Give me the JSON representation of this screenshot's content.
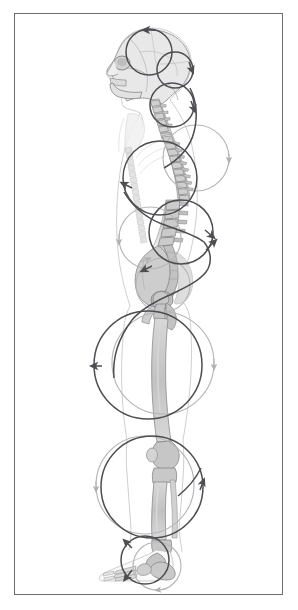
{
  "figure": {
    "title": "Spiral / circular motion pattern along the human skeleton in lateral (sagittal) view",
    "view": "lateral left side profile",
    "frame": {
      "border_color": "#6e6e6e",
      "background_color": "#ffffff",
      "inset_left": 14,
      "inset_top": 13,
      "width": 269,
      "height": 582
    },
    "palette": {
      "bone_fill": "#c9c9c9",
      "bone_fill_light": "#dedede",
      "bone_outline": "#8d8d8d",
      "body_outline": "#c4c4c4",
      "arrow_dark": "#4d4d52",
      "arrow_light": "#b3b3b3",
      "frame_line": "#6e6e6e",
      "background": "#ffffff"
    },
    "anatomy_regions": [
      {
        "name": "skull",
        "label": "Skull / cranium",
        "cy": 55
      },
      {
        "name": "mandible",
        "label": "Mandible and facial profile",
        "cy": 72
      },
      {
        "name": "cervical-spine",
        "label": "Cervical vertebrae C1-C7",
        "cy": 100
      },
      {
        "name": "thoracic-spine",
        "label": "Thoracic vertebrae T1-T12",
        "cy": 165
      },
      {
        "name": "lumbar-spine",
        "label": "Lumbar vertebrae L1-L5",
        "cy": 235
      },
      {
        "name": "sacrum-pelvis",
        "label": "Sacrum, ilium and pelvis",
        "cy": 285
      },
      {
        "name": "femur",
        "label": "Femur / thigh",
        "cy": 370
      },
      {
        "name": "knee",
        "label": "Knee joint",
        "cy": 432
      },
      {
        "name": "tibia-fibula",
        "label": "Tibia and fibula / lower leg",
        "cy": 490
      },
      {
        "name": "foot",
        "label": "Foot, tarsals and metatarsals",
        "cy": 560
      }
    ],
    "motion_circles": [
      {
        "id": "c1",
        "region": "cranium",
        "cx": 149,
        "cy": 52,
        "r": 23,
        "tone": "dark",
        "arrow_at": "top",
        "direction": "clockwise"
      },
      {
        "id": "c2",
        "region": "occiput",
        "cx": 175,
        "cy": 70,
        "r": 18,
        "tone": "dark",
        "arrow_at": "right",
        "direction": "clockwise"
      },
      {
        "id": "c3",
        "region": "cervical",
        "cx": 172,
        "cy": 105,
        "r": 22,
        "tone": "dark",
        "arrow_at": "right",
        "direction": "clockwise"
      },
      {
        "id": "c4",
        "region": "upper-thoracic",
        "cx": 196,
        "cy": 158,
        "r": 33,
        "tone": "light",
        "arrow_at": "right",
        "direction": "clockwise"
      },
      {
        "id": "c5",
        "region": "mid-thoracic",
        "cx": 160,
        "cy": 178,
        "r": 37,
        "tone": "dark",
        "arrow_at": "left",
        "direction": "clockwise"
      },
      {
        "id": "c6",
        "region": "lower-thoracic",
        "cx": 181,
        "cy": 232,
        "r": 32,
        "tone": "dark",
        "arrow_at": "right",
        "direction": "clockwise"
      },
      {
        "id": "c7",
        "region": "lumbar",
        "cx": 150,
        "cy": 238,
        "r": 31,
        "tone": "light",
        "arrow_at": "left",
        "direction": "clockwise"
      },
      {
        "id": "c8",
        "region": "pelvis",
        "cx": 163,
        "cy": 285,
        "r": 27,
        "tone": "light",
        "arrow_at": "top",
        "direction": "clockwise"
      },
      {
        "id": "c9",
        "region": "hip-thigh",
        "cx": 148,
        "cy": 365,
        "r": 54,
        "tone": "dark",
        "arrow_at": "left",
        "direction": "clockwise"
      },
      {
        "id": "c10",
        "region": "femur-shaft",
        "cx": 163,
        "cy": 363,
        "r": 51,
        "tone": "light",
        "arrow_at": "right",
        "direction": "clockwise"
      },
      {
        "id": "c11",
        "region": "knee-shank",
        "cx": 152,
        "cy": 487,
        "r": 51,
        "tone": "dark",
        "arrow_at": "right",
        "direction": "clockwise"
      },
      {
        "id": "c12",
        "region": "lower-shank",
        "cx": 145,
        "cy": 485,
        "r": 49,
        "tone": "light",
        "arrow_at": "left",
        "direction": "clockwise"
      },
      {
        "id": "c13",
        "region": "ankle",
        "cx": 145,
        "cy": 560,
        "r": 24,
        "tone": "dark",
        "arrow_at": "left",
        "direction": "clockwise"
      },
      {
        "id": "c14",
        "region": "forefoot",
        "cx": 157,
        "cy": 566,
        "r": 24,
        "tone": "light",
        "arrow_at": "bottom",
        "direction": "clockwise"
      }
    ],
    "spiral_path": {
      "description": "Continuous dark spiral traversing from the cranium through the spine, pelvis, femur, shank and terminating at the foot",
      "tone": "dark",
      "arrowhead_count": 10
    }
  }
}
